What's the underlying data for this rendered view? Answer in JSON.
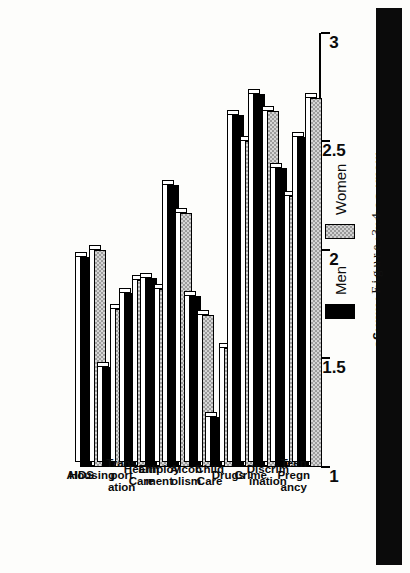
{
  "figure": {
    "caption": "Figure 3.4"
  },
  "legend": {
    "position": "below-plot",
    "entries": [
      {
        "label": "Men",
        "swatch": "solid-black"
      },
      {
        "label": "Women",
        "swatch": "gray-hatch"
      }
    ]
  },
  "chart_data": {
    "type": "bar",
    "orientation": "horizontal-rotated",
    "title": "",
    "subtitle": "",
    "xlabel": "",
    "ylabel": "Mean Social Problem Ratings",
    "ylim": [
      1,
      3
    ],
    "yticks": [
      "1",
      "1.5",
      "2",
      "2.5",
      "3"
    ],
    "ytick_values": [
      1,
      1.5,
      2,
      2.5,
      3
    ],
    "grid": false,
    "legend_position": "below",
    "categories": [
      "AIDS",
      "Housing",
      "Trans\nport\nation",
      "Health\nCare",
      "Employ\nment",
      "Alcoh\nolism",
      "Child\nCare",
      "Drugs",
      "Crime",
      "Discrim\nination",
      "Teen\nPregn\nancy"
    ],
    "series": [
      {
        "name": "Men",
        "color": "#000000",
        "values": [
          1.97,
          1.46,
          1.8,
          1.87,
          2.3,
          1.79,
          1.23,
          2.62,
          2.72,
          2.38,
          2.52
        ]
      },
      {
        "name": "Women",
        "color": "#d6d6d6",
        "values": [
          2.0,
          1.73,
          1.86,
          1.82,
          2.17,
          1.7,
          1.55,
          2.5,
          2.64,
          2.25,
          2.7
        ]
      }
    ]
  }
}
